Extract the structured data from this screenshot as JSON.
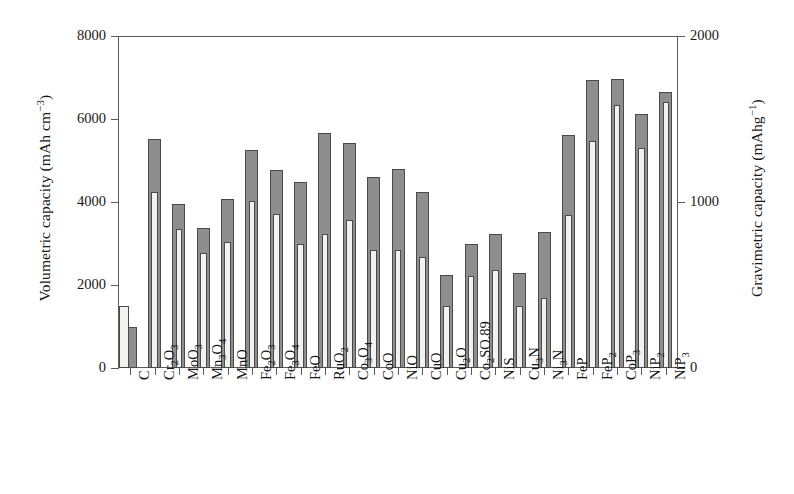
{
  "chart_data": {
    "type": "bar",
    "title": "",
    "subtitle": "",
    "categories": [
      "C",
      "Cr2O3",
      "MoO3",
      "Mn3O4",
      "MnO",
      "Fe2O3",
      "Fe3O4",
      "FeO",
      "RuO2",
      "Co3O4",
      "CoO",
      "NiO",
      "CuO",
      "Cu2O",
      "Co2SO.89",
      "NiS",
      "Cu3N",
      "Ni3N",
      "FeP",
      "FeP2",
      "CoP3",
      "NiP2",
      "NiP3"
    ],
    "category_labels": [
      "C",
      "Cr<sub>2</sub>O<sub>3</sub>",
      "MoO<sub>3</sub>",
      "Mn<sub>3</sub>O<sub>4</sub>",
      "MnO",
      "Fe<sub>2</sub>O<sub>3</sub>",
      "Fe<sub>3</sub>O<sub>4</sub>",
      "FeO",
      "RuO<sub>2</sub>",
      "Co<sub>3</sub>O<sub>4</sub>",
      "CoO",
      "NiO",
      "CuO",
      "Cu<sub>2</sub>O",
      "Co<sub>2</sub>SO.89",
      "NiS",
      "Cu<sub>3</sub>N",
      "Ni<sub>3</sub>N",
      "FeP",
      "FeP<sub>2</sub>",
      "CoP<sub>3</sub>",
      "NiP<sub>2</sub>",
      "NiP<sub>3</sub>"
    ],
    "series": [
      {
        "name": "Volumetric capacity",
        "axis": "left",
        "unit": "mAh cm-3",
        "color": "#8e8e8e",
        "values": [
          1000,
          5520,
          3950,
          3370,
          4070,
          5260,
          4780,
          4480,
          5660,
          5420,
          4600,
          4800,
          4240,
          2240,
          3000,
          3240,
          2300,
          3270,
          5620,
          6930,
          6960,
          6120,
          6650
        ]
      },
      {
        "name": "Gravimetric capacity",
        "axis": "right",
        "unit": "mAhg-1",
        "color": "#f2f2f0",
        "values": [
          372,
          1060,
          840,
          690,
          760,
          1005,
          925,
          745,
          805,
          890,
          710,
          710,
          670,
          375,
          555,
          590,
          375,
          420,
          920,
          1365,
          1585,
          1325,
          1605
        ]
      }
    ],
    "left_axis": {
      "label": "Volumetric capacity (mAh cm",
      "label_sup": "−3",
      "label_tail": ")",
      "min": 0,
      "max": 8000,
      "ticks": [
        0,
        2000,
        4000,
        6000,
        8000
      ],
      "tick_labels": [
        "0",
        "2000",
        "4000",
        "6000",
        "8000"
      ]
    },
    "right_axis": {
      "label": "Gravimetric capacity (mAhg",
      "label_sup": "−1",
      "label_tail": ")",
      "min": 0,
      "max": 2000,
      "ticks": [
        0,
        1000,
        2000
      ],
      "tick_labels": [
        "0",
        "1000",
        "2000"
      ]
    },
    "xlabel": "",
    "grid": false,
    "legend": null
  }
}
